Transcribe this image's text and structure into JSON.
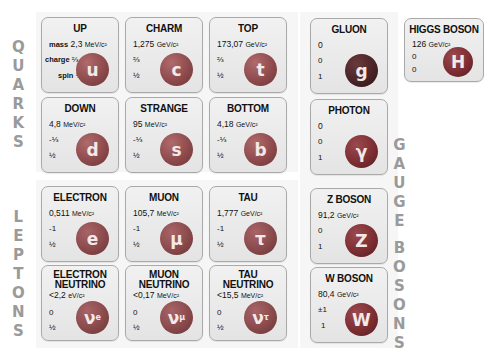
{
  "groups": {
    "quarks": "QUARKS",
    "leptons": "LEPTONS",
    "gauge_bosons": "GAUGE BOSONS"
  },
  "property_labels": {
    "mass": "mass",
    "charge": "charge",
    "spin": "spin"
  },
  "quarks": [
    {
      "name": "UP",
      "mass": "2,3",
      "unit": "MeV/c²",
      "charge": "⅔",
      "spin": "½",
      "symbol": "u"
    },
    {
      "name": "CHARM",
      "mass": "1,275",
      "unit": "GeV/c²",
      "charge": "⅔",
      "spin": "½",
      "symbol": "c"
    },
    {
      "name": "TOP",
      "mass": "173,07",
      "unit": "GeV/c²",
      "charge": "⅔",
      "spin": "½",
      "symbol": "t"
    },
    {
      "name": "DOWN",
      "mass": "4,8",
      "unit": "MeV/c²",
      "charge": "-⅓",
      "spin": "½",
      "symbol": "d"
    },
    {
      "name": "STRANGE",
      "mass": "95",
      "unit": "MeV/c²",
      "charge": "-⅓",
      "spin": "½",
      "symbol": "s"
    },
    {
      "name": "BOTTOM",
      "mass": "4,18",
      "unit": "GeV/c²",
      "charge": "-⅓",
      "spin": "½",
      "symbol": "b"
    }
  ],
  "leptons": [
    {
      "name": "ELECTRON",
      "mass": "0,511",
      "unit": "MeV/c²",
      "charge": "-1",
      "spin": "½",
      "symbol": "e"
    },
    {
      "name": "MUON",
      "mass": "105,7",
      "unit": "MeV/c²",
      "charge": "-1",
      "spin": "½",
      "symbol": "μ"
    },
    {
      "name": "TAU",
      "mass": "1,777",
      "unit": "GeV/c²",
      "charge": "-1",
      "spin": "½",
      "symbol": "τ"
    },
    {
      "name1": "ELECTRON",
      "name2": "NEUTRINO",
      "mass": "<2,2",
      "unit": "eV/c²",
      "charge": "0",
      "spin": "½",
      "symbol": "ν",
      "sub": "e"
    },
    {
      "name1": "MUON",
      "name2": "NEUTRINO",
      "mass": "<0,17",
      "unit": "MeV/c²",
      "charge": "0",
      "spin": "½",
      "symbol": "ν",
      "sub": "μ"
    },
    {
      "name1": "TAU",
      "name2": "NEUTRINO",
      "mass": "<15,5",
      "unit": "MeV/c²",
      "charge": "0",
      "spin": "½",
      "symbol": "ν",
      "sub": "τ"
    }
  ],
  "bosons": [
    {
      "name": "GLUON",
      "mass": "0",
      "unit": "",
      "charge": "0",
      "spin": "1",
      "symbol": "g"
    },
    {
      "name": "PHOTON",
      "mass": "0",
      "unit": "",
      "charge": "0",
      "spin": "1",
      "symbol": "γ"
    },
    {
      "name": "Z BOSON",
      "mass": "91,2",
      "unit": "GeV/c²",
      "charge": "0",
      "spin": "1",
      "symbol": "Z"
    },
    {
      "name": "W BOSON",
      "mass": "80,4",
      "unit": "GeV/c²",
      "charge": "±1",
      "spin": "1",
      "symbol": "W"
    },
    {
      "name": "HIGGS BOSON",
      "mass": "126",
      "unit": "GeV/c²",
      "charge": "0",
      "spin": "0",
      "symbol": "H"
    }
  ],
  "colors": {
    "quark_ball": "#8e4a4c",
    "lepton_ball": "#8a4a4c",
    "boson_ball": "#7d2e32",
    "gluon_ball": "#4a2426",
    "card_bg": "#e9e9e9",
    "card_border": "#a9a9a9",
    "group_label": "#9a9a9a"
  }
}
